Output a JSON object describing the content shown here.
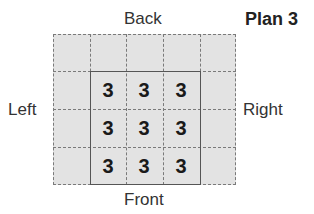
{
  "title": "Plan 3",
  "labels": {
    "back": "Back",
    "front": "Front",
    "left": "Left",
    "right": "Right"
  },
  "grid": {
    "columns": 5,
    "rows": 4,
    "plan_cells": [
      [
        "3",
        "3",
        "3"
      ],
      [
        "3",
        "3",
        "3"
      ],
      [
        "3",
        "3",
        "3"
      ]
    ]
  }
}
